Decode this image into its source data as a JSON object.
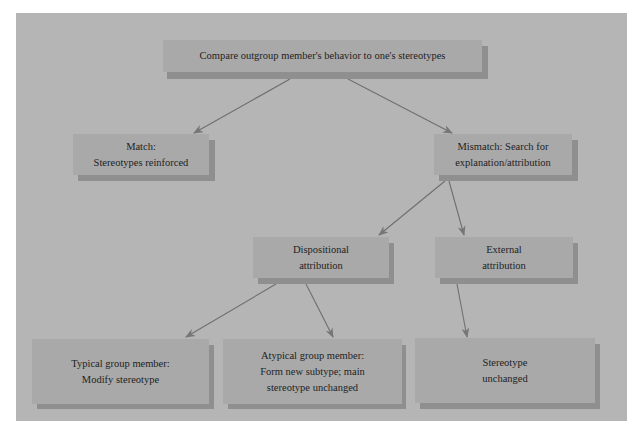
{
  "diagram": {
    "type": "flowchart",
    "colors": {
      "page_background": "#ffffff",
      "panel_background": "#b5b5b5",
      "box_fill": "#a9a9a9",
      "box_shadow": "#8f8f8f",
      "arrow": "#6f6f6f",
      "text": "#1e1e1e"
    },
    "nodes": {
      "compare": {
        "lines": [
          "Compare outgroup member's behavior to one's stereotypes"
        ]
      },
      "match": {
        "lines": [
          "Match:",
          "Stereotypes reinforced"
        ]
      },
      "mismatch": {
        "lines": [
          "Mismatch: Search for",
          "explanation/attribution"
        ]
      },
      "dispositional": {
        "lines": [
          "Dispositional",
          "attribution"
        ]
      },
      "external": {
        "lines": [
          "External",
          "attribution"
        ]
      },
      "typical": {
        "lines": [
          "Typical group member:",
          "Modify stereotype"
        ]
      },
      "atypical": {
        "lines": [
          "Atypical group member:",
          "Form new subtype; main",
          "stereotype unchanged"
        ]
      },
      "unchanged": {
        "lines": [
          "Stereotype",
          "unchanged"
        ]
      }
    },
    "edges": [
      {
        "from": "compare",
        "to": "match"
      },
      {
        "from": "compare",
        "to": "mismatch"
      },
      {
        "from": "mismatch",
        "to": "dispositional"
      },
      {
        "from": "mismatch",
        "to": "external"
      },
      {
        "from": "dispositional",
        "to": "typical"
      },
      {
        "from": "dispositional",
        "to": "atypical"
      },
      {
        "from": "external",
        "to": "unchanged"
      }
    ]
  }
}
